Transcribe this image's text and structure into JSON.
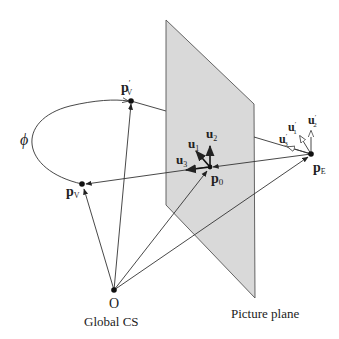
{
  "diagram": {
    "plane_label": "Picture plane",
    "origin_label": "O",
    "cs_label": "Global CS",
    "angle_label": "ϕ",
    "points": {
      "p_v_prime": {
        "base": "p",
        "sub": "V",
        "prime": "′"
      },
      "p_v": {
        "base": "p",
        "sub": "V"
      },
      "p_0": {
        "base": "p",
        "sub": "0"
      },
      "p_e": {
        "base": "p",
        "sub": "E"
      }
    },
    "vectors": {
      "u1": {
        "base": "u",
        "sub": "1"
      },
      "u2": {
        "base": "u",
        "sub": "2"
      },
      "u3": {
        "base": "u",
        "sub": "3"
      },
      "u1_prime": {
        "base": "u",
        "sub": "1",
        "prime": "′"
      },
      "u2_prime": {
        "base": "u",
        "sub": "2",
        "prime": "′"
      },
      "u3_prime": {
        "base": "u",
        "sub": "3",
        "prime": "′"
      }
    },
    "colors": {
      "plane_fill": "#d9d9d9",
      "plane_stroke": "#555555",
      "line": "#333333"
    }
  }
}
